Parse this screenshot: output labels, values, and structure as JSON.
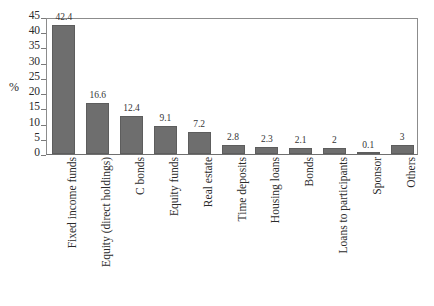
{
  "chart_data": {
    "type": "bar",
    "title": "",
    "subtitle": "",
    "xlabel": "",
    "ylabel": "%",
    "ylim": [
      0,
      45
    ],
    "ytick_step": 5,
    "yticks": [
      45,
      40,
      35,
      30,
      25,
      20,
      15,
      10,
      5,
      0
    ],
    "ytick_labels": [
      "45",
      "40",
      "35",
      "30",
      "25",
      "20",
      "15",
      "10",
      "5",
      "0"
    ],
    "grid": false,
    "legend": null,
    "bar_color": "#6e6e6e",
    "categories": [
      "Fixed income funds",
      "Equity (direct holdings)",
      "C bonds",
      "Equity funds",
      "Real estate",
      "Time deposits",
      "Housing loans",
      "Bonds",
      "Loans to participants",
      "Sponsor",
      "Others"
    ],
    "values": [
      42.4,
      16.6,
      12.4,
      9.1,
      7.2,
      2.8,
      2.3,
      2.1,
      2,
      0.1,
      3
    ],
    "value_labels": [
      "42.4",
      "16.6",
      "12.4",
      "9.1",
      "7.2",
      "2.8",
      "2.3",
      "2.1",
      "2",
      "0.1",
      "3"
    ]
  }
}
